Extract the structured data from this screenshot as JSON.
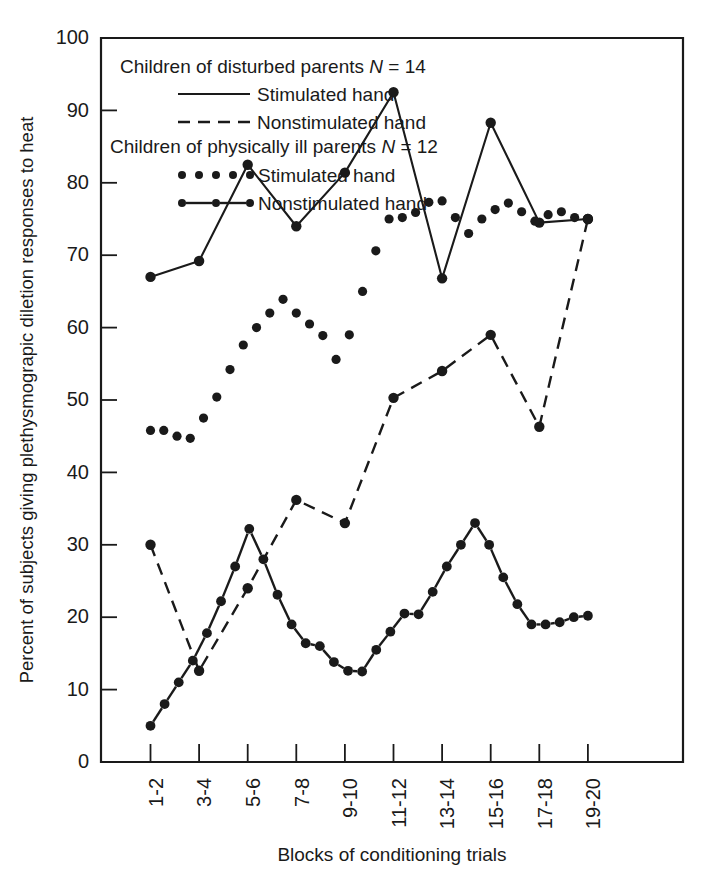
{
  "figure": {
    "background": "#ffffff",
    "ink_color": "#1a1a1a"
  },
  "axes": {
    "y_title": "Percent of subjects giving plethysmograpic diletion responses to heat",
    "x_title": "Blocks of conditioning trials",
    "y_ticks": [
      "0",
      "10",
      "20",
      "30",
      "40",
      "50",
      "60",
      "70",
      "80",
      "90",
      "100"
    ],
    "x_ticks": [
      "1-2",
      "3-4",
      "5-6",
      "7-8",
      "9-10",
      "11-12",
      "13-14",
      "15-16",
      "17-18",
      "19-20"
    ]
  },
  "legend": {
    "group1_title_prefix": "Children of disturbed parents ",
    "group1_n_symbol": "N",
    "group1_n_value": " = 14",
    "group1_title": "Children of disturbed parents N = 14",
    "group1_item1": "Stimulated hand",
    "group1_item2": "Nonstimulated hand",
    "group2_title_prefix": "Children of physically ill parents ",
    "group2_n_symbol": "N",
    "group2_n_value": " = 12",
    "group2_title": "Children of physically ill parents N = 12",
    "group2_item1": "Stimulated hand",
    "group2_item2": "Nonstimulated hand"
  },
  "chart_data": {
    "type": "line",
    "title": "",
    "xlabel": "Blocks of conditioning trials",
    "ylabel": "Percent of subjects giving plethysmograpic diletion responses to heat",
    "categories": [
      "1-2",
      "3-4",
      "5-6",
      "7-8",
      "9-10",
      "11-12",
      "13-14",
      "15-16",
      "17-18",
      "19-20"
    ],
    "ylim": [
      0,
      100
    ],
    "yticks": [
      0,
      10,
      20,
      30,
      40,
      50,
      60,
      70,
      80,
      90,
      100
    ],
    "grid": false,
    "legend_position": "top-left-inside",
    "series": [
      {
        "name": "Children of disturbed parents (N = 14) — Stimulated hand",
        "style": "solid-line-with-markers",
        "values": [
          67.0,
          69.2,
          82.5,
          74.0,
          81.4,
          92.5,
          66.8,
          88.3,
          74.5,
          75.0
        ]
      },
      {
        "name": "Children of disturbed parents (N = 14) — Nonstimulated hand",
        "style": "dashed-line-with-markers",
        "values": [
          30.0,
          12.6,
          24.0,
          36.2,
          33.0,
          50.3,
          54.0,
          59.0,
          46.3,
          75.0
        ]
      },
      {
        "name": "Children of physically ill parents (N = 12) — Stimulated hand",
        "style": "dotted-markers-only",
        "values_dense": [
          45.8,
          45.8,
          45.0,
          44.7,
          47.5,
          50.4,
          54.2,
          57.6,
          60.0,
          62.0,
          63.9,
          62.0,
          60.5,
          58.9,
          55.6,
          59.0,
          65.0,
          70.6,
          75.0,
          75.2,
          75.9,
          77.3,
          77.5,
          75.2,
          73.0,
          75.0,
          76.3,
          77.2,
          76.0,
          74.7,
          75.6,
          76.0,
          75.2,
          75.0
        ],
        "values_at_categories": [
          45.8,
          45.0,
          50.4,
          63.9,
          55.6,
          70.6,
          77.5,
          73.0,
          77.2,
          75.0
        ]
      },
      {
        "name": "Children of physically ill parents (N = 12) — Nonstimulated hand",
        "style": "dot-dash-line-with-markers",
        "values_dense": [
          5.0,
          8.0,
          11.0,
          14.0,
          17.8,
          22.2,
          27.0,
          32.2,
          28.0,
          23.1,
          19.0,
          16.4,
          16.0,
          13.8,
          12.6,
          12.5,
          15.5,
          18.0,
          20.5,
          20.4,
          23.5,
          27.0,
          30.0,
          33.0,
          30.0,
          25.5,
          21.8,
          19.0,
          19.0,
          19.3,
          20.0,
          20.2
        ],
        "values_at_categories": [
          5.0,
          14.0,
          27.0,
          32.2,
          16.4,
          12.5,
          20.5,
          33.0,
          19.0,
          20.2
        ]
      }
    ]
  }
}
